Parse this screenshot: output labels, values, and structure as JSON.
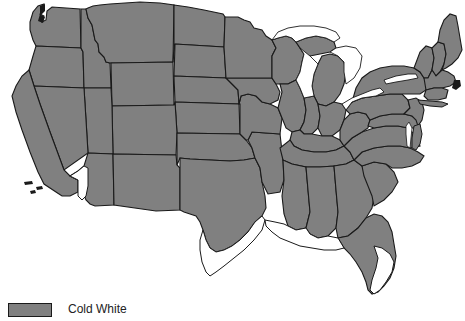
{
  "figure": {
    "type": "choropleth-map",
    "region": "contiguous-united-states",
    "background_color": "#ffffff"
  },
  "map": {
    "fill_color": "#808080",
    "unfilled_color": "#ffffff",
    "border_color": "#1a1a1a",
    "water_color": "#ffffff",
    "filled_label": "filled-gray-states",
    "unfilled_regions": [
      "southern-california-arizona-border",
      "southern-texas",
      "southern-louisiana-gulf-coast",
      "southern-florida",
      "great-lakes"
    ]
  },
  "legend": {
    "swatch_color": "#808080",
    "swatch_border_color": "#1a1a1a",
    "label": "Cold  White"
  }
}
